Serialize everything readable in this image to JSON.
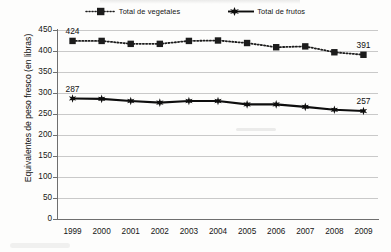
{
  "chart_data": {
    "type": "line",
    "title": "",
    "xlabel": "",
    "ylabel": "Equivalentes de peso fresco (en libras)",
    "categories": [
      "1999",
      "2000",
      "2001",
      "2002",
      "2003",
      "2004",
      "2005",
      "2006",
      "2007",
      "2008",
      "2009"
    ],
    "ylim": [
      0,
      450
    ],
    "yticks": [
      0,
      50,
      100,
      150,
      200,
      250,
      300,
      350,
      400,
      450
    ],
    "ytick_labels": [
      "0",
      "50",
      "100",
      "150",
      "200",
      "250",
      "300",
      "350",
      "400",
      "450"
    ],
    "grid": true,
    "legend_position": "top",
    "series": [
      {
        "name": "Total de vegetales",
        "marker": "square",
        "line_style": "dotted",
        "color": "#1c1c1c",
        "values": [
          424,
          424,
          417,
          417,
          424,
          425,
          419,
          409,
          411,
          397,
          391
        ],
        "point_labels": [
          {
            "index": 0,
            "text": "424"
          },
          {
            "index": 10,
            "text": "391"
          }
        ]
      },
      {
        "name": "Total de frutos",
        "marker": "star",
        "line_style": "solid",
        "color": "#0d0d0d",
        "values": [
          287,
          286,
          281,
          277,
          281,
          281,
          273,
          273,
          267,
          260,
          257
        ],
        "point_labels": [
          {
            "index": 0,
            "text": "287"
          },
          {
            "index": 10,
            "text": "257"
          }
        ]
      }
    ]
  },
  "legend": {
    "items": [
      {
        "label": "Total de vegetales",
        "key": "dotted-square-key"
      },
      {
        "label": "Total de frutos",
        "key": "solid-star-key"
      }
    ]
  },
  "colors": {
    "axis": "#6f6f6f",
    "grid": "#c9c9c9",
    "series_vegetables": "#1c1c1c",
    "series_fruits": "#0d0d0d",
    "text": "#151515",
    "background": "#fdfdfc"
  }
}
